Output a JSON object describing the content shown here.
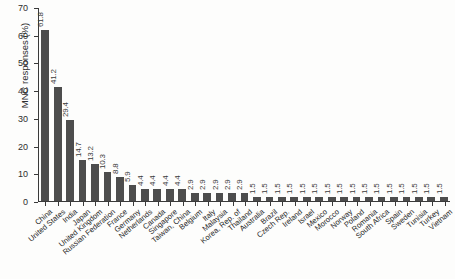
{
  "chart_data": {
    "type": "bar",
    "title": "",
    "xlabel": "",
    "ylabel": "MNC responses (%)",
    "ylim": [
      0,
      70
    ],
    "yticks": [
      0,
      10,
      20,
      30,
      40,
      50,
      60,
      70
    ],
    "grid": false,
    "legend": null,
    "bar_color": "#4d4d4d",
    "value_label_precision": 1,
    "categories": [
      "China",
      "United States",
      "India",
      "Japan",
      "United Kingdom",
      "Russian Federation",
      "France",
      "Germany",
      "Netherlands",
      "Canada",
      "Singapore",
      "Taiwan, China",
      "Belgium",
      "Italy",
      "Malaysia",
      "Korea, Rep. of",
      "Thailand",
      "Australia",
      "Brazil",
      "Czech Rep.",
      "Ireland",
      "Israel",
      "Mexico",
      "Morocco",
      "Norway",
      "Poland",
      "Romania",
      "South Africa",
      "Spain",
      "Sweden",
      "Tunisia",
      "Turkey",
      "Vietnam"
    ],
    "values": [
      61.8,
      41.2,
      29.4,
      14.7,
      13.2,
      10.3,
      8.8,
      5.9,
      4.4,
      4.4,
      4.4,
      4.4,
      2.9,
      2.9,
      2.9,
      2.9,
      2.9,
      1.5,
      1.5,
      1.5,
      1.5,
      1.5,
      1.5,
      1.5,
      1.5,
      1.5,
      1.5,
      1.5,
      1.5,
      1.5,
      1.5,
      1.5,
      1.5
    ],
    "value_labels": [
      "61.8",
      "41.2",
      "29.4",
      "14.7",
      "13.2",
      "10.3",
      "8.8",
      "5.9",
      "4.4",
      "4.4",
      "4.4",
      "4.4",
      "2.9",
      "2.9",
      "2.9",
      "2.9",
      "2.9",
      "1.5",
      "1.5",
      "1.5",
      "1.5",
      "1.5",
      "1.5",
      "1.5",
      "1.5",
      "1.5",
      "1.5",
      "1.5",
      "1.5",
      "1.5",
      "1.5",
      "1.5",
      "1.5"
    ]
  }
}
